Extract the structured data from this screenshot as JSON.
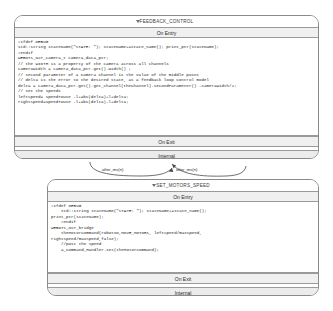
{
  "diagram": {
    "type": "stateflow-state-diagram",
    "background": "#ffffff",
    "border_color": "#8a8a8a",
    "bar_color": "#f0f0f0"
  },
  "states": [
    {
      "id": "feedback-control",
      "title": "FEEDBACK_CONTROL",
      "collapse_icon": "triangle-down-icon",
      "sections": [
        {
          "label": "On Entry"
        },
        {
          "label": "On Exit"
        },
        {
          "label": "Internal"
        }
      ],
      "code": "#ifdef DEBUG\nstd::string stateName(\"STATE: \"); stateName+=state_name(); print_ptr(stateName);\n#endif\nWEBOTS_NXT_camera_t camera_data_ptr;\n// the WIDTH is a property of the camera across all channels\ncameraWidth = camera_data_ptr.get().width() ;\n// second parameter of a Camera Channel is the value of the middle point\n// delta is the error to the desired state, as a feedback loop control model\ndelta = camera_data_ptr.get().get_channel(theChannel).secondParameter() -cameraWidth/2;\n// set the speeds\nleftSpeed= speedToUse -l+abs(delta)+l+delta;\nrightSpeed=speedToUse -l+abs(delta)-l+delta;"
    },
    {
      "id": "set-motors-speed",
      "title": "SET_MOTORS_SPEED",
      "collapse_icon": "triangle-down-icon",
      "sections": [
        {
          "label": "On Entry"
        },
        {
          "label": "On Exit"
        },
        {
          "label": "Internal"
        }
      ],
      "code": "#ifdef DEBUG\n    std::string stateName(\"STATE: \"); stateName+=state_name();\nprint_ptr(stateName);\n    #endif\nWEBOTS_NXT_bridge\n    theMotorCommand(robotID,MOVE_MOTORS, leftSpeed/maxSpeed,\nrightSpeed/maxSpeed,false);\n    //post the speed\n    a_Command_Handler.set(theMotorCommand);"
    }
  ],
  "transitions": [
    {
      "id": "t1",
      "label": "after_ms(n)"
    },
    {
      "id": "t2",
      "label": "after_ms(n)"
    }
  ]
}
